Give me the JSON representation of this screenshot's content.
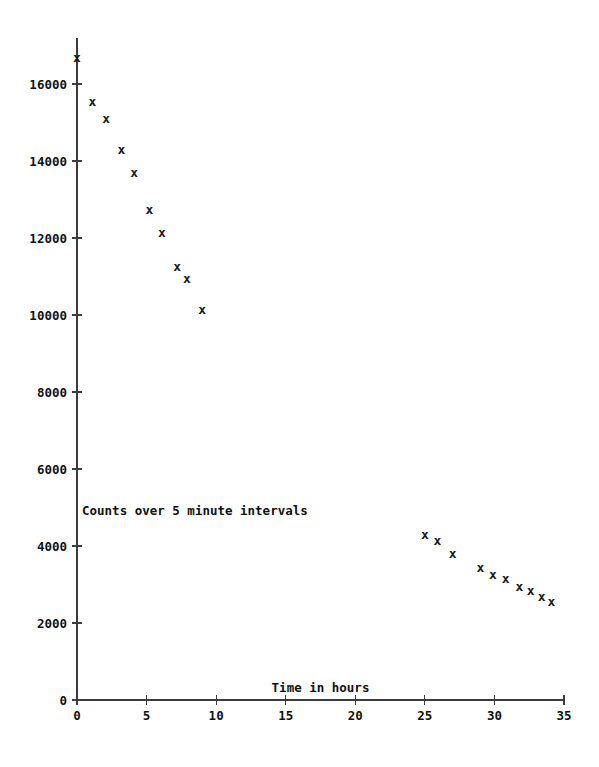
{
  "chart_data": {
    "type": "scatter",
    "title": "",
    "xlabel": "Time in hours",
    "ylabel": "",
    "annotation": "Counts over 5 minute intervals",
    "marker": "x",
    "marker_color": "#1a1a1a",
    "grid": false,
    "legend": "none",
    "xlim": [
      0,
      35
    ],
    "ylim": [
      0,
      17200
    ],
    "xticks": [
      0,
      5,
      10,
      15,
      20,
      25,
      30,
      35
    ],
    "xtick_labels": [
      "0",
      "5",
      "10",
      "15",
      "20",
      "25",
      "30",
      "35"
    ],
    "yticks": [
      0,
      2000,
      4000,
      6000,
      8000,
      10000,
      12000,
      14000,
      16000
    ],
    "ytick_labels": [
      "0",
      "2000",
      "4000",
      "6000",
      "8000",
      "10000",
      "12000",
      "14000",
      "16000"
    ],
    "series": [
      {
        "name": "Counts over 5 minute intervals",
        "x": [
          0.0,
          1.1,
          2.1,
          3.2,
          4.1,
          5.2,
          6.1,
          7.2,
          7.9,
          9.0,
          25.0,
          25.9,
          27.0,
          29.0,
          29.9,
          30.8,
          31.8,
          32.6,
          33.4,
          34.1
        ],
        "y": [
          16700,
          15550,
          15100,
          14300,
          13700,
          12750,
          12150,
          11250,
          10950,
          10150,
          4300,
          4150,
          3800,
          3450,
          3250,
          3150,
          2950,
          2850,
          2700,
          2550
        ]
      }
    ]
  },
  "axes": {
    "x_axis_name": "time-axis",
    "y_axis_name": "counts-axis"
  },
  "colors": {
    "axis": "#3c3c3c",
    "text": "#111111",
    "marker": "#1a1a1a",
    "background": "#ffffff"
  }
}
